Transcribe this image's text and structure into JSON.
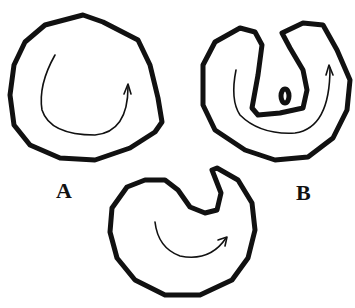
{
  "figure": {
    "type": "line-drawing",
    "background": "#ffffff",
    "ink_color": "#111111",
    "shapes": [
      {
        "id": "A",
        "description": "rounded closed outline with curved flow arrow inside",
        "has_label": true
      },
      {
        "id": "B",
        "description": "outline folded into U shape with inner tongue and small oval, curved flow arrow",
        "has_label": true
      },
      {
        "id": "middle",
        "description": "rounded outline with notch at top, curved flow arrow",
        "has_label": false
      }
    ]
  },
  "labels": {
    "a": "A",
    "b": "B"
  }
}
